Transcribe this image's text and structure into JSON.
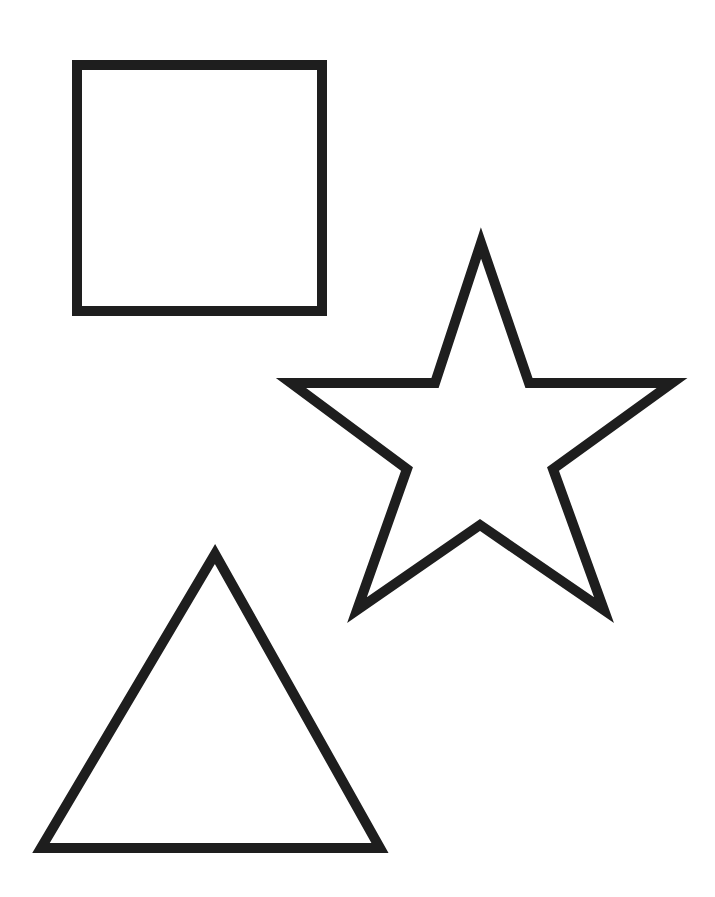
{
  "page": {
    "background": "#ffffff",
    "stroke_color": "#1e1e1e",
    "stroke_width": 10
  },
  "shapes": [
    {
      "name": "square",
      "type": "polygon",
      "points": "77,65 322,65 322,311 77,311"
    },
    {
      "name": "star",
      "type": "polygon",
      "points": "481,243 435,383 291,383 407,469 357,610 480,525 604,610 553,469 672,383 529,383"
    },
    {
      "name": "triangle",
      "type": "polygon",
      "points": "215,554 41,848 380,848"
    }
  ]
}
